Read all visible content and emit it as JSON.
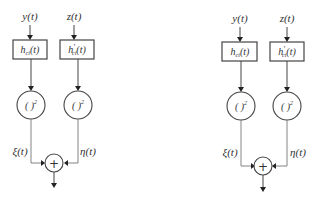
{
  "diagrams": [
    {
      "name": "left",
      "inputs": {
        "top_left": "y(t)",
        "top_right": "z(t)"
      },
      "filters": [
        {
          "base": "h",
          "prime": "",
          "sub": "ci",
          "arg": "(t)"
        },
        {
          "base": "h",
          "prime": "′",
          "sub": "ci",
          "arg": "(t)"
        }
      ],
      "squarers": [
        {
          "base": "( )",
          "exp": "2"
        },
        {
          "base": "( )",
          "exp": "2"
        }
      ],
      "signals": {
        "left": "ξ(t)",
        "right": "η(t)"
      },
      "summer": "+"
    },
    {
      "name": "right",
      "inputs": {
        "top_left": "y(t)",
        "top_right": "z(t)"
      },
      "filters": [
        {
          "base": "h",
          "prime": "",
          "sub": "ct",
          "arg": "(t)"
        },
        {
          "base": "h",
          "prime": "′",
          "sub": "ct",
          "arg": "(t)"
        }
      ],
      "squarers": [
        {
          "base": "( )",
          "exp": "2"
        },
        {
          "base": "( )",
          "exp": "2"
        }
      ],
      "signals": {
        "left": "ξ(t)",
        "right": "η(t)"
      },
      "summer": "+"
    }
  ]
}
